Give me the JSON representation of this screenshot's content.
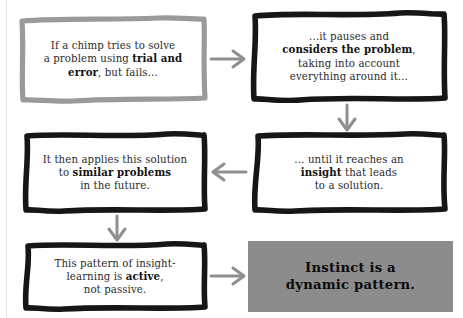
{
  "diagram": {
    "colors": {
      "box_border_gray": "#9a9a9a",
      "box_border_black": "#1a1a1a",
      "conclusion_fill": "#8c8c8c",
      "arrow_gray": "#8f8f8f",
      "text": "#2b2b2b",
      "background": "#ffffff"
    },
    "nodes": [
      {
        "id": "node-1",
        "name": "trial-and-error-box",
        "border_style": "gray-sketch",
        "lines": [
          {
            "text": "If a chimp tries to solve"
          },
          {
            "text": "a problem using ",
            "bold_tail": "trial and"
          },
          {
            "bold_head": "error",
            "text": ", but fails…"
          }
        ],
        "plain_text": "If a chimp tries to solve a problem using trial and error, but fails…"
      },
      {
        "id": "node-2",
        "name": "considers-problem-box",
        "border_style": "black-sketch",
        "lines": [
          {
            "text": "…it pauses and"
          },
          {
            "bold_head": "considers the problem",
            "text": ","
          },
          {
            "text": "taking into account"
          },
          {
            "text": "everything around it…"
          }
        ],
        "plain_text": "…it pauses and considers the problem, taking into account everything around it…"
      },
      {
        "id": "node-3",
        "name": "insight-box",
        "border_style": "black-sketch",
        "lines": [
          {
            "text": "… until it reaches an"
          },
          {
            "bold_head": "insight",
            "text": " that leads"
          },
          {
            "text": "to a solution."
          }
        ],
        "plain_text": "… until it reaches an insight that leads to a solution."
      },
      {
        "id": "node-4",
        "name": "similar-problems-box",
        "border_style": "black-sketch",
        "lines": [
          {
            "text": "It then applies this solution"
          },
          {
            "text": "to ",
            "bold_tail": "similar problems"
          },
          {
            "text": "in the future."
          }
        ],
        "plain_text": "It then applies this solution to similar problems in the future."
      },
      {
        "id": "node-5",
        "name": "active-learning-box",
        "border_style": "black-sketch",
        "lines": [
          {
            "text": "This pattern of insight-"
          },
          {
            "text": "learning is ",
            "bold_tail": "active"
          },
          {
            "text": ", not passive."
          }
        ],
        "plain_text": "This pattern of insight-learning is active, not passive."
      },
      {
        "id": "node-6",
        "name": "conclusion-box",
        "border_style": "filled-gray",
        "lines": [
          {
            "text": "Instinct is a"
          },
          {
            "text": "dynamic pattern."
          }
        ],
        "plain_text": "Instinct is a dynamic pattern."
      }
    ],
    "arrows": [
      {
        "name": "arrow-node1-to-node2",
        "direction": "right",
        "from": "node-1",
        "to": "node-2"
      },
      {
        "name": "arrow-node2-to-node3",
        "direction": "down",
        "from": "node-2",
        "to": "node-3"
      },
      {
        "name": "arrow-node3-to-node4",
        "direction": "left",
        "from": "node-3",
        "to": "node-4"
      },
      {
        "name": "arrow-node4-to-node5",
        "direction": "down",
        "from": "node-4",
        "to": "node-5"
      },
      {
        "name": "arrow-node5-to-node6",
        "direction": "right",
        "from": "node-5",
        "to": "node-6"
      }
    ]
  }
}
